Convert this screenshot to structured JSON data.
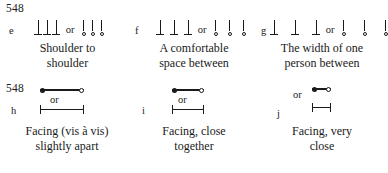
{
  "figure": {
    "rows": [
      {
        "tag": "548",
        "or_label": "or",
        "groups": [
          {
            "key": "e",
            "caption_line1": "Shoulder to",
            "caption_line2": "shoulder",
            "spacing": "tight",
            "symbol_left": "three-vertical-pins-with-feet",
            "symbol_right": "three-vertical-pins-with-circles"
          },
          {
            "key": "f",
            "caption_line1": "A comfortable",
            "caption_line2": "space between",
            "spacing": "medium",
            "symbol_left": "three-vertical-pins-with-feet",
            "symbol_right": "three-vertical-pins-with-circles"
          },
          {
            "key": "g",
            "caption_line1": "The width of one",
            "caption_line2": "person between",
            "spacing": "wide",
            "symbol_left": "three-vertical-pins-with-feet",
            "symbol_right": "three-vertical-pins-with-circles"
          }
        ]
      },
      {
        "tag": "548",
        "or_label": "or",
        "groups": [
          {
            "key": "h",
            "caption_line1": "Facing (vis à vis)",
            "caption_line2": "slightly apart",
            "spacing": "wide",
            "symbol_top": "filled-dot-line-open-dot",
            "symbol_bottom": "i-beam-measure"
          },
          {
            "key": "i",
            "caption_line1": "Facing, close",
            "caption_line2": "together",
            "spacing": "medium",
            "symbol_top": "filled-dot-line-open-dot",
            "symbol_bottom": "i-beam-measure"
          },
          {
            "key": "j",
            "caption_line1": "Facing, very",
            "caption_line2": "close",
            "spacing": "tight",
            "symbol_top": "filled-dot-line-open-dot",
            "symbol_bottom": "i-beam-measure"
          }
        ]
      }
    ]
  }
}
